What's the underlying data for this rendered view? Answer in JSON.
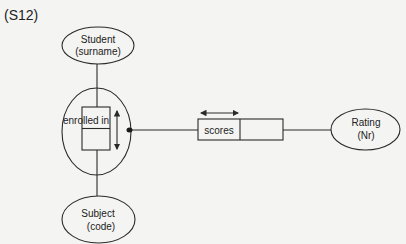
{
  "diagram": {
    "label": "(S12)",
    "entities": {
      "student": {
        "name": "Student",
        "attribute": "(surname)"
      },
      "subject": {
        "name": "Subject",
        "attribute": "(code)"
      },
      "rating": {
        "name": "Rating",
        "attribute": "(Nr)"
      }
    },
    "fact_type": {
      "name": "enrolled in"
    },
    "scores_fact": {
      "name": "scores"
    },
    "colors": {
      "stroke": "#2a2a2a",
      "background": "#f4f4f2"
    }
  }
}
